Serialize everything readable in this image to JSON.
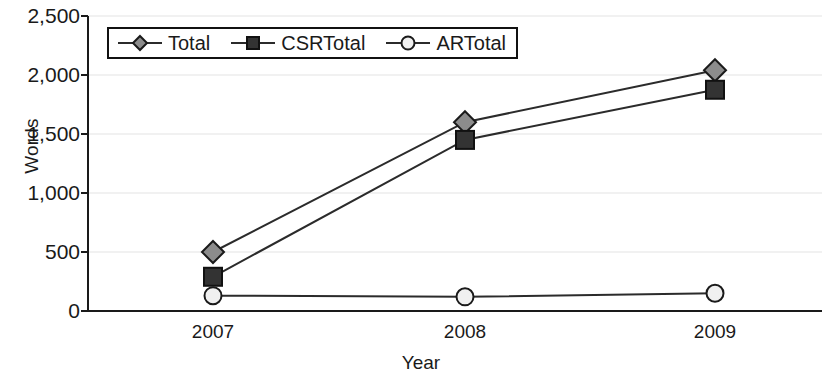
{
  "chart_data": {
    "type": "line",
    "title": "",
    "xlabel": "Year",
    "ylabel": "Words",
    "categories": [
      "2007",
      "2008",
      "2009"
    ],
    "x": [
      2007,
      2008,
      2009
    ],
    "xlim": [
      2006.5,
      2009.5
    ],
    "ylim": [
      0,
      2500
    ],
    "yticks": [
      0,
      500,
      1000,
      1500,
      2000,
      2500
    ],
    "ytick_labels": [
      "0",
      "500",
      "1,000",
      "1,500",
      "2,000",
      "2,500"
    ],
    "grid": true,
    "legend_position": "upper-left-inside",
    "series": [
      {
        "name": "Total",
        "marker": "diamond",
        "marker_fill": "#8c8c8c",
        "marker_stroke": "#1a1a1a",
        "line_color": "#2b2b2b",
        "values": [
          500,
          1600,
          2040
        ]
      },
      {
        "name": "CSRTotal",
        "marker": "square",
        "marker_fill": "#333333",
        "marker_stroke": "#111111",
        "line_color": "#2b2b2b",
        "values": [
          290,
          1450,
          1875
        ]
      },
      {
        "name": "ARTotal",
        "marker": "circle",
        "marker_fill": "#f0f0f0",
        "marker_stroke": "#1a1a1a",
        "line_color": "#2b2b2b",
        "values": [
          130,
          120,
          150
        ]
      }
    ]
  },
  "axes": {
    "y_title": "Words",
    "x_title": "Year",
    "y_labels": [
      "2,500",
      "2,000",
      "1,500",
      "1,000",
      "500",
      "0"
    ],
    "x_labels": [
      "2007",
      "2008",
      "2009"
    ]
  },
  "legend": {
    "items": [
      {
        "label": "Total",
        "icon": "diamond-marker-icon"
      },
      {
        "label": "CSRTotal",
        "icon": "square-marker-icon"
      },
      {
        "label": "ARTotal",
        "icon": "circle-marker-icon"
      }
    ]
  },
  "colors": {
    "axis": "#1a1a1a",
    "grid": "#e3e3e3",
    "line": "#2b2b2b",
    "diamond_fill": "#8c8c8c",
    "square_fill": "#333333",
    "circle_fill": "#f0f0f0",
    "background": "#ffffff"
  }
}
